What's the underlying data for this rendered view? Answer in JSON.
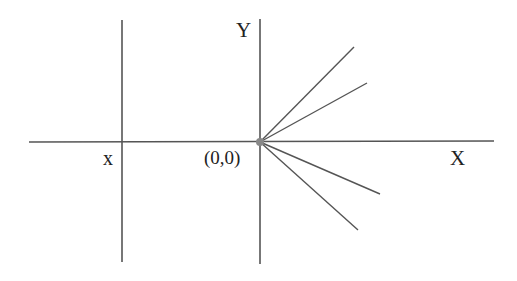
{
  "diagram": {
    "type": "coordinate-axes-with-rays",
    "labels": {
      "y_axis": "Y",
      "x_axis": "X",
      "x_position": "x",
      "origin": "(0,0)"
    },
    "colors": {
      "background": "#ffffff",
      "line": "#555555",
      "origin_dot": "#888888",
      "text": "#222222"
    },
    "axes": {
      "horizontal": {
        "x1": 29,
        "y1": 142,
        "x2": 494,
        "y2": 141
      },
      "vertical_y": {
        "x1": 260,
        "y1": 19,
        "x2": 260,
        "y2": 264
      },
      "vertical_x": {
        "x1": 122,
        "y1": 20,
        "x2": 122,
        "y2": 262
      }
    },
    "origin_point": {
      "cx": 260,
      "cy": 142,
      "r": 4
    },
    "rays": [
      {
        "x1": 260,
        "y1": 142,
        "x2": 354,
        "y2": 47
      },
      {
        "x1": 260,
        "y1": 142,
        "x2": 367,
        "y2": 83
      },
      {
        "x1": 260,
        "y1": 142,
        "x2": 380,
        "y2": 194
      },
      {
        "x1": 260,
        "y1": 142,
        "x2": 358,
        "y2": 230
      }
    ]
  }
}
